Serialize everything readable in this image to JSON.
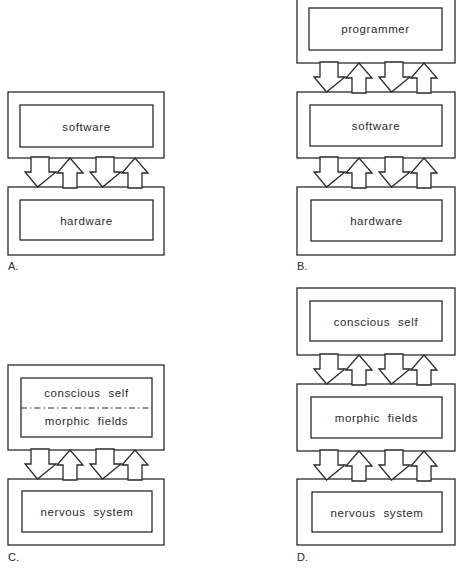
{
  "diagram": {
    "panels": [
      {
        "id": "A",
        "label": "A.",
        "boxes": [
          {
            "text": "software"
          },
          {
            "text": "hardware"
          }
        ]
      },
      {
        "id": "B",
        "label": "B.",
        "boxes": [
          {
            "text": "programmer"
          },
          {
            "text": "software"
          },
          {
            "text": "hardware"
          }
        ]
      },
      {
        "id": "C",
        "label": "C.",
        "boxes": [
          {
            "text": "conscious self",
            "text2": "morphic fields",
            "divider": "dash-dot"
          },
          {
            "text": "nervous system"
          }
        ]
      },
      {
        "id": "D",
        "label": "D.",
        "boxes": [
          {
            "text": "conscious self"
          },
          {
            "text": "morphic fields"
          },
          {
            "text": "nervous system"
          }
        ]
      }
    ],
    "connector": "two-way interaction arrows (down, up, down, up) between adjacent levels",
    "colors": {
      "line": "#2a2a2a",
      "background": "#ffffff"
    }
  }
}
